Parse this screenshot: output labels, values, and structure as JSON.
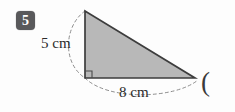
{
  "question": {
    "number": "5"
  },
  "figure": {
    "shape_name": "right-triangle",
    "fill_color": "#b8b8b8",
    "stroke_color": "#3d3d3d",
    "vertices": {
      "apex": [
        85,
        11
      ],
      "right_angle": [
        85,
        78
      ],
      "base_right": [
        195,
        78
      ]
    },
    "right_angle_marker": true,
    "height_label": "5 cm",
    "base_label": "8 cm",
    "height_value": 5,
    "base_value": 8,
    "units": "cm",
    "dashed_arc_color": "#8d8d8d"
  },
  "trailing_text": "(",
  "colors": {
    "background": "#fdfdfd",
    "badge_background": "#59595b",
    "badge_text": "#ffffff",
    "label_text": "#2b2b2b"
  }
}
